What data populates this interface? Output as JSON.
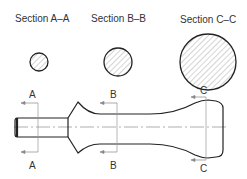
{
  "sections": [
    {
      "id": "A",
      "title": "Section A–A",
      "cx": 39,
      "cy": 62,
      "r": 9,
      "cut_x": 38
    },
    {
      "id": "B",
      "title": "Section B–B",
      "cx": 118,
      "cy": 62,
      "r": 14,
      "cut_x": 117
    },
    {
      "id": "C",
      "title": "Section C–C",
      "cx": 208,
      "cy": 62,
      "r": 28,
      "cut_x": 205
    }
  ],
  "cut_labels": {
    "A_top": "A",
    "A_bottom": "A",
    "B_top": "B",
    "B_bottom": "B",
    "C_top": "C",
    "C_bottom": "C"
  },
  "colors": {
    "outline": "#222222",
    "hatch": "#aaaaaa",
    "centerline": "#999999",
    "text": "#333333"
  }
}
